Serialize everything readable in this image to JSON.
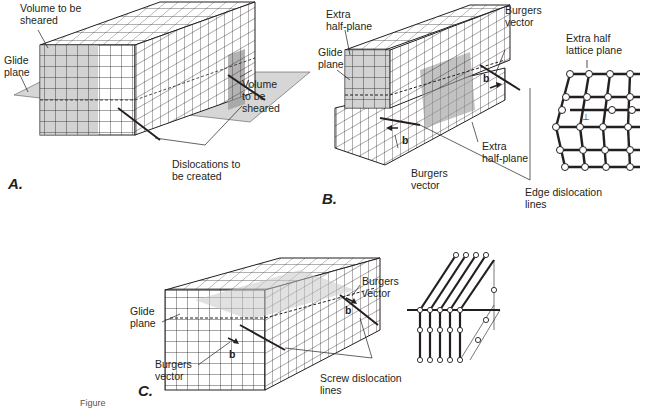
{
  "figure": {
    "panels": [
      {
        "id": "A",
        "letter": "A.",
        "labels": {
          "volume_top": "Volume to be\nsheared",
          "glide_plane": "Glide\nplane",
          "volume_right": "Volume\nto be\nsheared",
          "dislocations": "Dislocations to\nbe created"
        }
      },
      {
        "id": "B",
        "letter": "B.",
        "labels": {
          "extra_half_plane_top": "Extra\nhalf-plane",
          "glide_plane": "Glide\nplane",
          "burgers_top": "Burgers\nvector",
          "b_top": "b",
          "b_bottom": "b",
          "burgers_bottom": "Burgers\nvector",
          "extra_half_plane_right": "Extra\nhalf-plane",
          "edge_lines": "Edge dislocation\nlines",
          "extra_lattice": "Extra half\nlattice plane",
          "dislocation_symbol": "⊥"
        }
      },
      {
        "id": "C",
        "letter": "C.",
        "labels": {
          "glide_plane": "Glide\nplane",
          "burgers_left": "Burgers\nvector",
          "b_left": "b",
          "burgers_right": "Burgers\nvector",
          "b_right": "b",
          "screw_lines": "Screw dislocation\nlines"
        }
      }
    ],
    "caption": "Figure"
  }
}
